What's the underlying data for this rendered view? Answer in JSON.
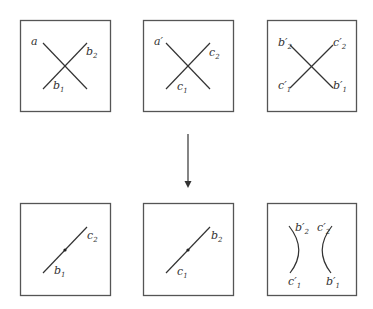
{
  "diagram": {
    "type": "crossing-resolution",
    "arrow": {
      "direction": "down",
      "icon": "down-arrow-icon"
    },
    "top_row": [
      {
        "id": "crossing-1",
        "labels": {
          "top_left": "a",
          "top_right": "b",
          "top_right_sub": "2",
          "bottom_left": "b",
          "bottom_left_sub": "1"
        }
      },
      {
        "id": "crossing-2",
        "labels": {
          "top_left": "a′",
          "top_right": "c",
          "top_right_sub": "2",
          "bottom_left": "c",
          "bottom_left_sub": "1"
        }
      },
      {
        "id": "crossing-3",
        "labels": {
          "top_left": "b′",
          "top_left_sub": "2",
          "top_right": "c′",
          "top_right_sub": "2",
          "bottom_left": "c′",
          "bottom_left_sub": "1",
          "bottom_right": "b′",
          "bottom_right_sub": "1"
        }
      }
    ],
    "bottom_row": [
      {
        "id": "segment-1",
        "labels": {
          "top_right": "c",
          "top_right_sub": "2",
          "bottom_left": "b",
          "bottom_left_sub": "1"
        }
      },
      {
        "id": "segment-2",
        "labels": {
          "top_right": "b",
          "top_right_sub": "2",
          "bottom_left": "c",
          "bottom_left_sub": "1"
        }
      },
      {
        "id": "smoothing-3",
        "labels": {
          "top_left": "b′",
          "top_left_sub": "2",
          "top_right": "c′",
          "top_right_sub": "2",
          "bottom_left": "c′",
          "bottom_left_sub": "1",
          "bottom_right": "b′",
          "bottom_right_sub": "1"
        }
      }
    ]
  }
}
